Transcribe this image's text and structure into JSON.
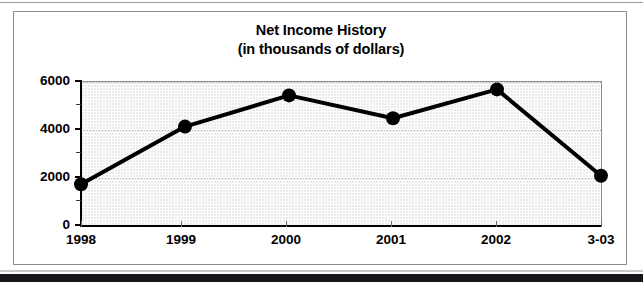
{
  "chart_data": {
    "type": "line",
    "title": "Net Income History",
    "subtitle": "(in thousands of dollars)",
    "xlabel": "",
    "ylabel": "",
    "categories": [
      "1998",
      "1999",
      "2000",
      "2001",
      "2002",
      "3-03"
    ],
    "values": [
      1700,
      4100,
      5400,
      4450,
      5650,
      2050
    ],
    "series": [
      {
        "name": "Net Income",
        "values": [
          1700,
          4100,
          5400,
          4450,
          5650,
          2050
        ]
      }
    ],
    "ylim": [
      0,
      6000
    ],
    "y_ticks": [
      0,
      2000,
      4000,
      6000
    ],
    "y_tick_labels": [
      "0",
      "2000",
      "4000",
      "6000"
    ],
    "y_minor_ticks": [
      1000,
      3000,
      5000
    ],
    "grid": true,
    "legend": "none",
    "marker": "filled-circle",
    "line_color": "#000000",
    "marker_color": "#000000",
    "plot_background": "#ebebeb",
    "frame_color": "#8d8d8d"
  }
}
